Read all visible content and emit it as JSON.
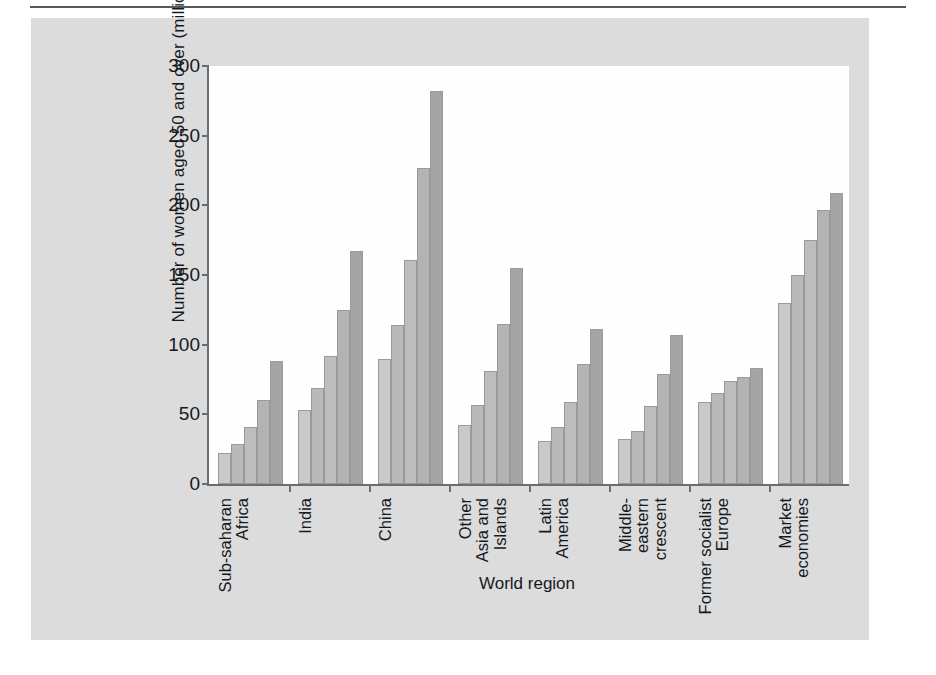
{
  "chart_data": {
    "type": "bar",
    "title": "",
    "xlabel": "World region",
    "ylabel": "Number of women aged 50 and over (millions)",
    "ylim": [
      0,
      300
    ],
    "yticks": [
      0,
      50,
      100,
      150,
      200,
      250,
      300
    ],
    "grid": false,
    "legend": "none",
    "categories": [
      "Sub-saharan Africa",
      "India",
      "China",
      "Other Asia and Islands",
      "Latin America",
      "Middle-eastern crescent",
      "Former socialist Europe",
      "Market economies"
    ],
    "category_lines": [
      [
        "Sub-saharan",
        "Africa"
      ],
      [
        "India"
      ],
      [
        "China"
      ],
      [
        "Other",
        "Asia and",
        "Islands"
      ],
      [
        "Latin",
        "America"
      ],
      [
        "Middle-",
        "eastern",
        "crescent"
      ],
      [
        "Former socialist",
        "Europe"
      ],
      [
        "Market",
        "economies"
      ]
    ],
    "series": [
      {
        "name": "bar-1",
        "values": [
          22,
          53,
          90,
          42,
          31,
          32,
          59,
          130
        ]
      },
      {
        "name": "bar-2",
        "values": [
          29,
          69,
          114,
          57,
          41,
          38,
          65,
          150
        ]
      },
      {
        "name": "bar-3",
        "values": [
          41,
          92,
          161,
          81,
          59,
          56,
          74,
          175
        ]
      },
      {
        "name": "bar-4",
        "values": [
          60,
          125,
          227,
          115,
          86,
          79,
          77,
          197
        ]
      },
      {
        "name": "bar-5",
        "values": [
          88,
          167,
          282,
          155,
          111,
          107,
          83,
          209
        ]
      }
    ],
    "bar_colors": [
      "#c9c9c9",
      "#b9b9b9",
      "#bdbdbd",
      "#b3b3b3",
      "#a4a4a4"
    ],
    "axis_color": "#6a6e72",
    "panel_color": "#dcdcdc",
    "plot_background": "#fefefe",
    "text_color": "#16191c"
  }
}
